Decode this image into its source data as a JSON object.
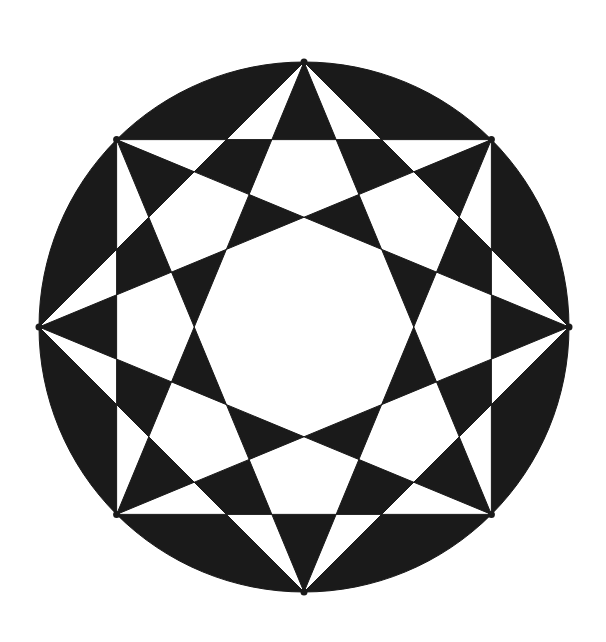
{
  "figure": {
    "title": "",
    "center": [
      304,
      327
    ],
    "radius": 265,
    "vertex_count": 8,
    "fill_color": "#1a1a1a",
    "background_color": "#ffffff"
  }
}
